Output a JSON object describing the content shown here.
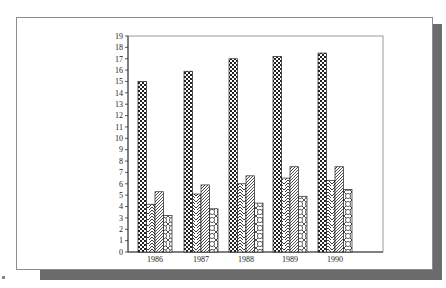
{
  "chart_data": {
    "type": "bar",
    "title": "",
    "xlabel": "",
    "ylabel": "",
    "categories": [
      "1986",
      "1987",
      "1988",
      "1989",
      "1990"
    ],
    "series": [
      {
        "name": "Series 1",
        "pattern": "checker",
        "values": [
          15.0,
          15.9,
          17.0,
          17.2,
          17.5
        ]
      },
      {
        "name": "Series 2",
        "pattern": "chevron",
        "values": [
          4.2,
          5.1,
          6.0,
          6.5,
          6.3
        ]
      },
      {
        "name": "Series 3",
        "pattern": "diagonal",
        "values": [
          5.3,
          5.9,
          6.7,
          7.5,
          7.5
        ]
      },
      {
        "name": "Series 4",
        "pattern": "circles",
        "values": [
          3.2,
          3.8,
          4.3,
          4.9,
          5.5
        ]
      }
    ],
    "ylim": [
      0,
      19
    ],
    "yticks": [
      0,
      1,
      2,
      3,
      4,
      5,
      6,
      7,
      8,
      9,
      10,
      11,
      12,
      13,
      14,
      15,
      16,
      17,
      18,
      19
    ],
    "grid": false,
    "legend": "none"
  },
  "colors": {
    "axis": "#333333",
    "frame": "#8c8c8c",
    "shadow": "#6b6b6b",
    "bar_outline": "#222222"
  }
}
